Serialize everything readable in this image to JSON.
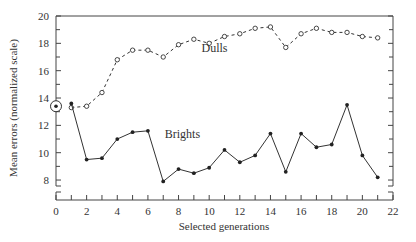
{
  "chart_data": {
    "type": "line",
    "title": "",
    "xlabel": "Selected generations",
    "ylabel": "Mean errors (normalized scale)",
    "xlim": [
      0,
      22
    ],
    "ylim": [
      7,
      20
    ],
    "y_axis_break": true,
    "grid": false,
    "x_ticks": [
      0,
      2,
      4,
      6,
      8,
      10,
      12,
      14,
      16,
      18,
      20,
      22
    ],
    "y_ticks": [
      8,
      10,
      12,
      14,
      16,
      18,
      20
    ],
    "start_point": {
      "x": 0,
      "y": 13.4,
      "marker": "circled-dot"
    },
    "series": [
      {
        "name": "Dulls",
        "style": "dashed",
        "marker": "open-circle",
        "label_pos": {
          "x": 9.5,
          "y": 17.4
        },
        "x": [
          1,
          2,
          3,
          4,
          5,
          6,
          7,
          8,
          9,
          10,
          11,
          12,
          13,
          14,
          15,
          16,
          17,
          18,
          19,
          20,
          21
        ],
        "values": [
          13.3,
          13.4,
          14.4,
          16.8,
          17.5,
          17.5,
          17.0,
          17.9,
          18.3,
          18.0,
          18.5,
          18.7,
          19.1,
          19.2,
          17.7,
          18.7,
          19.1,
          18.8,
          18.8,
          18.5,
          18.4
        ]
      },
      {
        "name": "Brights",
        "style": "solid",
        "marker": "filled-dot",
        "label_pos": {
          "x": 7.1,
          "y": 11.1
        },
        "x": [
          1,
          2,
          3,
          4,
          5,
          6,
          7,
          8,
          9,
          10,
          11,
          12,
          13,
          14,
          15,
          16,
          17,
          18,
          19,
          20,
          21
        ],
        "values": [
          13.6,
          9.5,
          9.6,
          11.0,
          11.5,
          11.6,
          7.9,
          8.8,
          8.5,
          8.9,
          10.2,
          9.3,
          9.8,
          11.4,
          8.6,
          11.4,
          10.4,
          10.6,
          13.5,
          9.8,
          8.2
        ]
      }
    ]
  }
}
